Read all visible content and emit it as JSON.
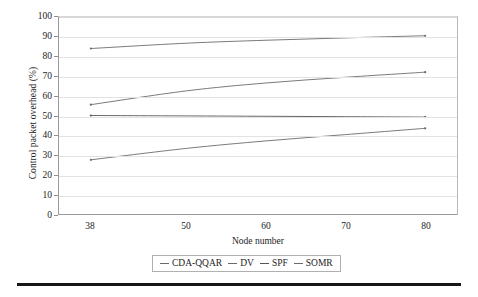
{
  "chart_data": {
    "type": "line",
    "title": "",
    "xlabel": "Node number",
    "ylabel": "Control packet overhead (%)",
    "x": [
      38,
      50,
      60,
      70,
      80
    ],
    "xlim": [
      34,
      84
    ],
    "ylim": [
      0,
      100
    ],
    "xticks": [
      38,
      50,
      60,
      70,
      80
    ],
    "yticks": [
      0,
      10,
      20,
      30,
      40,
      50,
      60,
      70,
      80,
      90,
      100
    ],
    "grid": "horizontal",
    "legend_position": "below-axis-centered",
    "series": [
      {
        "name": "CDA-QQAR",
        "color": "#6a6a6a",
        "values": [
          84.0,
          86.7,
          88.2,
          89.4,
          90.5
        ]
      },
      {
        "name": "DV",
        "color": "#6a6a6a",
        "values": [
          55.5,
          62.5,
          66.5,
          69.4,
          72.0
        ]
      },
      {
        "name": "SPF",
        "color": "#555555",
        "values": [
          50.0,
          49.8,
          49.6,
          49.4,
          49.2
        ]
      },
      {
        "name": "SOMR",
        "color": "#6a6a6a",
        "values": [
          27.5,
          33.3,
          37.1,
          40.3,
          43.5
        ]
      }
    ]
  },
  "axes": {
    "x_title": "Node number",
    "y_title": "Control packet overhead (%)",
    "x_tick_labels": [
      "38",
      "50",
      "60",
      "70",
      "80"
    ],
    "y_tick_labels": [
      "0",
      "10",
      "20",
      "30",
      "40",
      "50",
      "60",
      "70",
      "80",
      "90",
      "100"
    ]
  },
  "legend": {
    "entries": [
      {
        "label": "CDA-QQAR"
      },
      {
        "label": "DV"
      },
      {
        "label": "SPF"
      },
      {
        "label": "SOMR"
      }
    ]
  }
}
